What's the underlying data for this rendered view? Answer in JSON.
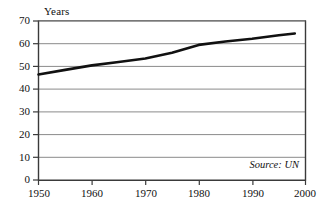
{
  "chart_data": {
    "type": "line",
    "title": "",
    "subtitle": "",
    "xlabel": "",
    "ylabel": "Years",
    "xlim": [
      1950,
      2000
    ],
    "ylim": [
      0,
      70
    ],
    "grid": true,
    "legend_position": "none",
    "x_ticks": [
      "1950",
      "1960",
      "1970",
      "1980",
      "1990",
      "2000"
    ],
    "y_ticks": [
      "0",
      "10",
      "20",
      "30",
      "40",
      "50",
      "60",
      "70"
    ],
    "annotations": [
      {
        "name": "source-note",
        "text": "Source: UN"
      }
    ],
    "series": [
      {
        "name": "Life expectancy",
        "color": "#111111",
        "x": [
          1950,
          1955,
          1960,
          1965,
          1970,
          1975,
          1980,
          1985,
          1990,
          1995,
          1998
        ],
        "values": [
          46.5,
          48.5,
          50.5,
          52.0,
          53.5,
          56.0,
          59.5,
          61.0,
          62.2,
          63.7,
          64.5
        ]
      }
    ]
  },
  "axis": {
    "y_title": "Years"
  },
  "ticks": {
    "y": [
      {
        "label": "70",
        "value": 70
      },
      {
        "label": "60",
        "value": 60
      },
      {
        "label": "50",
        "value": 50
      },
      {
        "label": "40",
        "value": 40
      },
      {
        "label": "30",
        "value": 30
      },
      {
        "label": "20",
        "value": 20
      },
      {
        "label": "10",
        "value": 10
      },
      {
        "label": "0",
        "value": 0
      }
    ],
    "x": [
      {
        "label": "1950",
        "value": 1950
      },
      {
        "label": "1960",
        "value": 1960
      },
      {
        "label": "1970",
        "value": 1970
      },
      {
        "label": "1980",
        "value": 1980
      },
      {
        "label": "1990",
        "value": 1990
      },
      {
        "label": "2000",
        "value": 2000
      }
    ]
  },
  "note": {
    "source": "Source: UN"
  },
  "colors": {
    "line": "#111111",
    "grid": "#8a8a8a",
    "axis": "#3a3a3a",
    "background": "#ffffff"
  }
}
